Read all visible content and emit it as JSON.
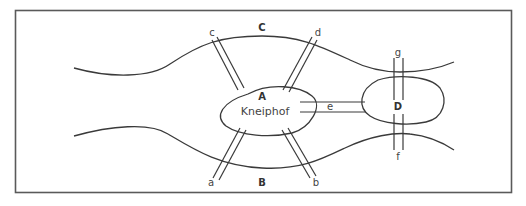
{
  "diagram": {
    "landmasses": {
      "A": {
        "label": "A",
        "name": "Kneiphof"
      },
      "B": {
        "label": "B"
      },
      "C": {
        "label": "C"
      },
      "D": {
        "label": "D"
      }
    },
    "bridges": [
      {
        "label": "a",
        "connects": [
          "A",
          "B"
        ]
      },
      {
        "label": "b",
        "connects": [
          "A",
          "B"
        ]
      },
      {
        "label": "c",
        "connects": [
          "A",
          "C"
        ]
      },
      {
        "label": "d",
        "connects": [
          "A",
          "C"
        ]
      },
      {
        "label": "e",
        "connects": [
          "A",
          "D"
        ]
      },
      {
        "label": "f",
        "connects": [
          "B",
          "D"
        ]
      },
      {
        "label": "g",
        "connects": [
          "C",
          "D"
        ]
      }
    ],
    "colors": {
      "line": "#3a3a3a",
      "frame": "#5a5a5a",
      "background": "#ffffff"
    }
  }
}
